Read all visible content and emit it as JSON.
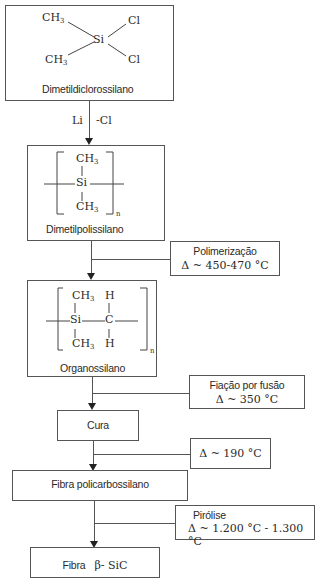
{
  "diagram": {
    "nodes": [
      {
        "id": "dimetildiclorossilano",
        "label": "Dimetildiclorossilano",
        "formula": {
          "center": "Si",
          "substituents": [
            "CH3",
            "CH3",
            "Cl",
            "Cl"
          ]
        }
      },
      {
        "id": "dimetilpolissilano",
        "label": "Dimetilpolissilano",
        "formula": {
          "top": "CH3",
          "center": "Si",
          "bottom": "CH3",
          "repeat": "n"
        }
      },
      {
        "id": "organossilano",
        "label": "Organossilano",
        "formula": {
          "left_top": "CH3",
          "left_center": "Si",
          "left_bottom": "CH3",
          "right_top": "H",
          "right_center": "C",
          "right_bottom": "H",
          "repeat": "n"
        }
      },
      {
        "id": "cura",
        "label": "Cura"
      },
      {
        "id": "fibra-policarbossilano",
        "label": "Fibra policarbossilano"
      },
      {
        "id": "fibra-sic",
        "label": "Fibra",
        "label_symbol": "β- SiC"
      }
    ],
    "reagents": {
      "left": "Li",
      "right": "-Cl"
    },
    "conditions": [
      {
        "step": "Polimerização",
        "temp": "Δ ~ 450-470 °C"
      },
      {
        "step": "Fiação por fusão",
        "temp": "Δ ~ 350 °C"
      },
      {
        "step": "",
        "temp": "Δ ~ 190 °C"
      },
      {
        "step": "Pirólise",
        "temp": "Δ ~ 1.200 °C - 1.300 °C"
      }
    ],
    "symbols": {
      "ch3": "CH",
      "three": "3",
      "si": "Si",
      "cl": "Cl",
      "c": "C",
      "h": "H",
      "n": "n"
    }
  }
}
